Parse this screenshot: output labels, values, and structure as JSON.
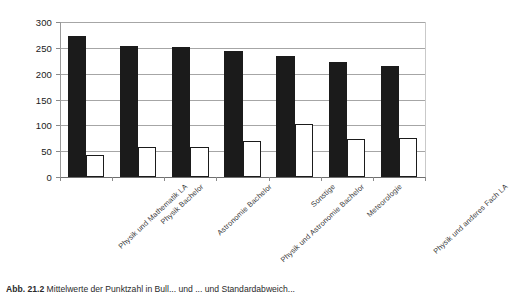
{
  "figure": {
    "caption_label": "Abb. 21.2",
    "caption_text": "Mittelwerte der Punktzahl in Bull... und ... und Standardabweich..."
  },
  "chart_data": {
    "type": "bar",
    "title": "",
    "xlabel": "",
    "ylabel": "",
    "ylim": [
      0,
      300
    ],
    "yticks": [
      0,
      50,
      100,
      150,
      200,
      250,
      300
    ],
    "ytick_labels": [
      "0",
      "50",
      "100",
      "150",
      "200",
      "250",
      "300"
    ],
    "grid": true,
    "legend": "none",
    "categories": [
      "Physik und Mathematik LA",
      "Physik Bachelor",
      "Astronomie Bachelor",
      "Physik und Astronomie Bachelor",
      "Sonstige",
      "Meteorologie",
      "Physik und anderes Fach LA"
    ],
    "series": [
      {
        "name": "Mittelwert",
        "color": "#1b1b1b",
        "fill": "solid",
        "values": [
          272,
          254,
          251,
          244,
          235,
          223,
          215
        ]
      },
      {
        "name": "Standardabweichung",
        "color": "#ffffff",
        "fill": "outline",
        "values": [
          43,
          59,
          59,
          70,
          102,
          73,
          75
        ]
      }
    ]
  }
}
